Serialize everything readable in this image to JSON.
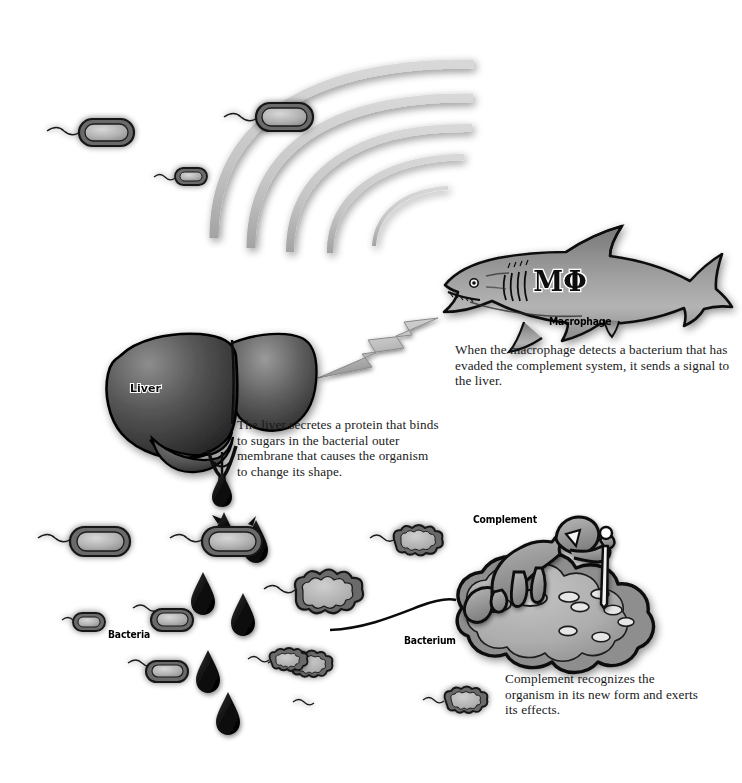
{
  "figure": {
    "background_color": "#ffffff",
    "style": "grayscale medical illustration"
  },
  "labels": {
    "liver": "Liver",
    "macrophage": "Macrophage",
    "bacteria": "Bacteria",
    "bacterium": "Bacterium",
    "complement": "Complement",
    "macrophage_symbol": "MΦ"
  },
  "captions": {
    "macrophage": "When the macrophage detects a bacterium that has evaded the complement system, it sends a signal to the liver.",
    "liver": "The liver secretes a protein that binds to sugars in the bacterial outer membrane that causes the organism to change its shape.",
    "complement": "Complement recognizes the organism in its new form and exerts its effects."
  },
  "colors": {
    "ink": "#000000",
    "wave_gray": "#c9c9c9",
    "wave_gray_dark": "#9f9f9f",
    "organism_fill": "#b5b5b5",
    "organism_fill_light": "#d2d2d2",
    "liver_dark": "#3b3b3b",
    "liver_mid": "#7a7a7a",
    "shark_gray": "#9a9a9a",
    "bolt_gray": "#bdbdbd",
    "drop_black": "#111111",
    "text": "#1a1a1a",
    "background": "#ffffff"
  },
  "elements": {
    "signal_waves": {
      "name": "signal-waves",
      "count": 5,
      "description": "Concentric gray arcs radiating from the macrophage toward the bacteria"
    },
    "lightning_bolt": {
      "name": "lightning-bolt",
      "description": "Signal from macrophage to liver"
    },
    "shark": {
      "name": "macrophage-shark",
      "description": "Shark representing the macrophage, marked MΦ"
    },
    "liver": {
      "name": "liver-organ",
      "description": "Liver with portal vessels secreting a droplet"
    },
    "protein_drops": {
      "name": "protein-droplets",
      "count": 8,
      "description": "Teardrop-shaped protein droplets falling from the liver onto bacteria"
    },
    "rod_bacteria": {
      "name": "rod-bacteria",
      "count": 7,
      "description": "Flagellated rod-shaped bacteria in their normal form"
    },
    "bumpy_bacteria": {
      "name": "transformed-bacteria",
      "count": 4,
      "description": "Bacteria that changed to a bumpy, lobed shape after protein binding"
    },
    "complement_figure": {
      "name": "complement-figure",
      "description": "Humanoid complement figure punching holes in the bacterium surface"
    },
    "membrane_holes": {
      "name": "membrane-pores",
      "count": 7,
      "description": "Pores punched in the bacterial membrane by complement"
    }
  }
}
